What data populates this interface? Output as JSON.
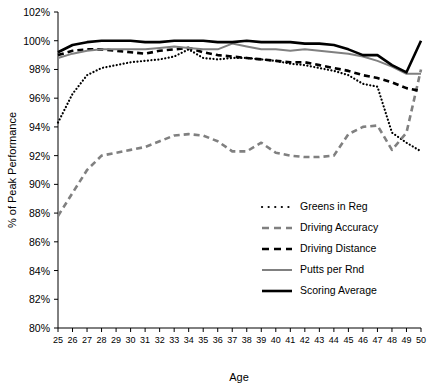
{
  "chart_data": {
    "type": "line",
    "title": "",
    "xlabel": "Age",
    "ylabel": "% of Peak Performance",
    "xlim": [
      25,
      50
    ],
    "ylim": [
      80,
      102
    ],
    "ytick_step": 2,
    "grid": false,
    "legend_position": "inside-lower-right",
    "x": [
      25,
      26,
      27,
      28,
      29,
      30,
      31,
      32,
      33,
      34,
      35,
      36,
      37,
      38,
      39,
      40,
      41,
      42,
      43,
      44,
      45,
      46,
      47,
      48,
      49,
      50
    ],
    "xtick_labels": [
      "25",
      "26",
      "27",
      "28",
      "29",
      "30",
      "31",
      "32",
      "33",
      "34",
      "35",
      "36",
      "37",
      "38",
      "39",
      "40",
      "41",
      "42",
      "43",
      "44",
      "45",
      "46",
      "47",
      "48",
      "49",
      "50"
    ],
    "ytick_labels": [
      "80%",
      "82%",
      "84%",
      "86%",
      "88%",
      "90%",
      "92%",
      "94%",
      "96%",
      "98%",
      "100%",
      "102%"
    ],
    "series": [
      {
        "name": "Greens in Reg",
        "style": "dotted",
        "color": "#000000",
        "values": [
          94.3,
          96.3,
          97.6,
          98.1,
          98.3,
          98.5,
          98.6,
          98.7,
          98.9,
          99.4,
          98.8,
          98.7,
          98.8,
          98.8,
          98.7,
          98.6,
          98.4,
          98.3,
          98.1,
          97.9,
          97.6,
          97.0,
          96.8,
          93.6,
          92.9,
          92.3
        ]
      },
      {
        "name": "Driving Accuracy",
        "style": "dashed",
        "color": "#808080",
        "values": [
          87.8,
          89.4,
          91.0,
          92.0,
          92.2,
          92.4,
          92.6,
          93.0,
          93.4,
          93.5,
          93.4,
          93.0,
          92.3,
          92.3,
          92.9,
          92.2,
          92.0,
          91.9,
          91.9,
          92.0,
          93.5,
          94.0,
          94.1,
          92.4,
          93.6,
          98.0
        ]
      },
      {
        "name": "Driving Distance",
        "style": "dashed",
        "color": "#000000",
        "values": [
          99.0,
          99.3,
          99.4,
          99.4,
          99.3,
          99.2,
          99.1,
          99.3,
          99.4,
          99.5,
          99.2,
          99.0,
          98.9,
          98.8,
          98.7,
          98.6,
          98.5,
          98.5,
          98.3,
          98.1,
          97.9,
          97.6,
          97.4,
          97.1,
          96.7,
          96.5
        ]
      },
      {
        "name": "Putts per Rnd",
        "style": "solid",
        "color": "#808080",
        "values": [
          98.8,
          99.1,
          99.3,
          99.4,
          99.4,
          99.4,
          99.4,
          99.5,
          99.6,
          99.5,
          99.4,
          99.4,
          99.8,
          99.6,
          99.4,
          99.4,
          99.3,
          99.4,
          99.3,
          99.2,
          99.1,
          98.9,
          98.6,
          98.2,
          97.7,
          97.7
        ]
      },
      {
        "name": "Scoring Average",
        "style": "solid",
        "color": "#000000",
        "values": [
          99.2,
          99.7,
          99.9,
          100.0,
          100.0,
          100.0,
          99.9,
          99.9,
          100.0,
          100.0,
          100.0,
          99.9,
          99.9,
          100.0,
          99.9,
          99.9,
          99.9,
          99.8,
          99.8,
          99.7,
          99.4,
          99.0,
          99.0,
          98.3,
          97.8,
          100.0
        ]
      }
    ]
  },
  "legend": {
    "entries": [
      {
        "label": "Greens in Reg"
      },
      {
        "label": "Driving Accuracy"
      },
      {
        "label": "Driving Distance"
      },
      {
        "label": "Putts per Rnd"
      },
      {
        "label": "Scoring Average"
      }
    ]
  },
  "axes": {
    "x_title": "Age",
    "y_title": "% of Peak Performance"
  }
}
